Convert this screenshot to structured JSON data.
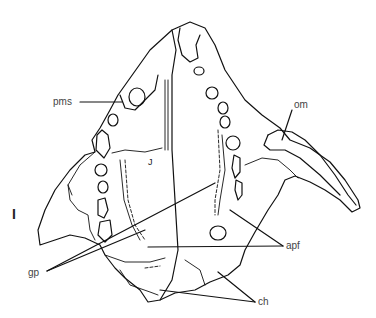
{
  "figure": {
    "type": "anatomical line drawing",
    "panel_label": "I",
    "inner_mark": "J",
    "labels": [
      {
        "id": "pms",
        "text": "pms"
      },
      {
        "id": "om",
        "text": "om"
      },
      {
        "id": "apf",
        "text": "apf"
      },
      {
        "id": "gp",
        "text": "gp"
      },
      {
        "id": "ch",
        "text": "ch"
      }
    ],
    "line_color": "#111111",
    "label_color": "#444444",
    "background": "#ffffff"
  }
}
